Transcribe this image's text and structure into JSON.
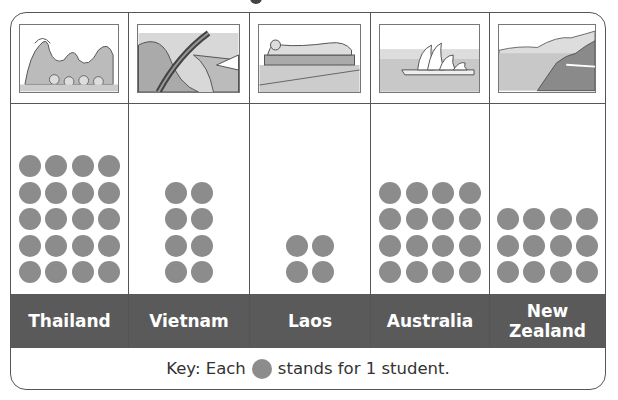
{
  "chart_data": {
    "type": "pictograph",
    "title": "",
    "categories": [
      "Thailand",
      "Vietnam",
      "Laos",
      "Australia",
      "New Zealand"
    ],
    "values": [
      20,
      8,
      4,
      16,
      12
    ],
    "symbol_unit": 1,
    "key": "Key: Each ● stands for 1 student.",
    "columns_per_category": [
      4,
      2,
      2,
      4,
      4
    ]
  },
  "columns": [
    {
      "label": "Thailand",
      "picture": "dragon-statue-icon",
      "count": 20,
      "per_row": 4
    },
    {
      "label": "Vietnam",
      "picture": "hand-bridge-icon",
      "count": 8,
      "per_row": 2
    },
    {
      "label": "Laos",
      "picture": "reclining-buddha-icon",
      "count": 4,
      "per_row": 2
    },
    {
      "label": "Australia",
      "picture": "opera-house-icon",
      "count": 16,
      "per_row": 4
    },
    {
      "label": "New Zealand",
      "picture": "fjord-landscape-icon",
      "count": 12,
      "per_row": 4
    }
  ],
  "key": {
    "prefix": "Key: Each",
    "suffix": "stands for 1 student."
  },
  "colors": {
    "dot": "#8c8c8c",
    "label_bar": "#5a5a5a",
    "border": "#555555"
  }
}
